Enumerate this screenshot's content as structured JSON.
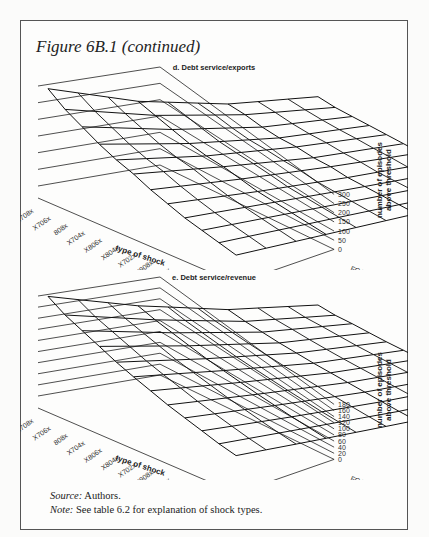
{
  "figure": {
    "title": "Figure 6B.1 (continued)",
    "source_label": "Source:",
    "source_text": " Authors.",
    "note_label": "Note:",
    "note_text": " See table 6.2 for explanation of shock types."
  },
  "chart_data": [
    {
      "type": "surface3d",
      "title": "d. Debt service/exports",
      "xlabel": "type of shock",
      "ylabel": "",
      "zlabel": "number of episodes above threshold",
      "shock_types": [
        "X708x",
        "X706x",
        "808x",
        "X704x",
        "X806x",
        "X804x",
        "X702x",
        "X908x",
        "X906x",
        "X802x",
        "X904x",
        "X902x"
      ],
      "thresholds": [
        "FC10",
        "FC20",
        "FC30",
        "FC40"
      ],
      "z_ticks": [
        0,
        50,
        100,
        150,
        200,
        250,
        300
      ],
      "zlim": [
        0,
        300
      ],
      "values": [
        [
          310,
          200,
          120,
          70
        ],
        [
          270,
          180,
          110,
          60
        ],
        [
          240,
          160,
          95,
          55
        ],
        [
          210,
          140,
          85,
          50
        ],
        [
          185,
          125,
          80,
          45
        ],
        [
          165,
          115,
          70,
          40
        ],
        [
          140,
          100,
          65,
          35
        ],
        [
          120,
          85,
          55,
          30
        ],
        [
          100,
          75,
          50,
          28
        ],
        [
          85,
          65,
          45,
          25
        ],
        [
          70,
          55,
          40,
          22
        ],
        [
          55,
          45,
          35,
          20
        ]
      ]
    },
    {
      "type": "surface3d",
      "title": "e. Debt service/revenue",
      "xlabel": "type of shock",
      "ylabel": "",
      "zlabel": "number of episodes above threshold",
      "shock_types": [
        "X708x",
        "X706x",
        "808x",
        "X704x",
        "X806x",
        "X804x",
        "X702x",
        "X908x",
        "X906x",
        "X802x",
        "X904x",
        "X902x"
      ],
      "thresholds": [
        "FC10",
        "FC20",
        "FC30",
        "FC40"
      ],
      "z_ticks": [
        0,
        20,
        40,
        60,
        80,
        100,
        120,
        140,
        160,
        180
      ],
      "zlim": [
        0,
        180
      ],
      "values": [
        [
          190,
          130,
          80,
          45
        ],
        [
          170,
          118,
          72,
          40
        ],
        [
          155,
          108,
          66,
          38
        ],
        [
          140,
          98,
          60,
          35
        ],
        [
          125,
          88,
          55,
          32
        ],
        [
          112,
          80,
          50,
          30
        ],
        [
          100,
          72,
          46,
          28
        ],
        [
          88,
          64,
          42,
          26
        ],
        [
          78,
          57,
          38,
          24
        ],
        [
          68,
          50,
          34,
          22
        ],
        [
          58,
          44,
          30,
          20
        ],
        [
          50,
          38,
          27,
          18
        ]
      ]
    }
  ]
}
